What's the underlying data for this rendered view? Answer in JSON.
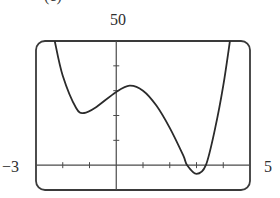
{
  "chart_data": {
    "type": "line",
    "title": "",
    "partial_label": "(c)",
    "xlabel": "",
    "ylabel": "",
    "xlim": [
      -3,
      5
    ],
    "ylim": [
      -10,
      50
    ],
    "window_labels": {
      "xmin": "−3",
      "xmax": "5",
      "ymax": "50"
    },
    "x_ticks": [
      -2,
      -1,
      1,
      2,
      3,
      4
    ],
    "y_ticks": [
      10,
      20,
      30,
      40
    ],
    "grid": false,
    "legend": null,
    "series": [
      {
        "name": "f(x)",
        "color": "#2b2b2b",
        "points": [
          {
            "x": -2.3,
            "y": 50
          },
          {
            "x": -2.0,
            "y": 36
          },
          {
            "x": -1.5,
            "y": 23
          },
          {
            "x": -1.2,
            "y": 21
          },
          {
            "x": -0.8,
            "y": 23
          },
          {
            "x": 0.0,
            "y": 29.5
          },
          {
            "x": 0.5,
            "y": 32
          },
          {
            "x": 1.0,
            "y": 30
          },
          {
            "x": 1.5,
            "y": 24
          },
          {
            "x": 2.0,
            "y": 15
          },
          {
            "x": 2.5,
            "y": 4
          },
          {
            "x": 2.65,
            "y": 0
          },
          {
            "x": 3.0,
            "y": -3.5
          },
          {
            "x": 3.35,
            "y": 0
          },
          {
            "x": 3.7,
            "y": 15
          },
          {
            "x": 4.0,
            "y": 32
          },
          {
            "x": 4.25,
            "y": 50
          }
        ]
      }
    ]
  },
  "style": {
    "frame_color": "#3a3a3a",
    "axis_color": "#4a4a4a",
    "curve_color": "#2b2b2b"
  }
}
